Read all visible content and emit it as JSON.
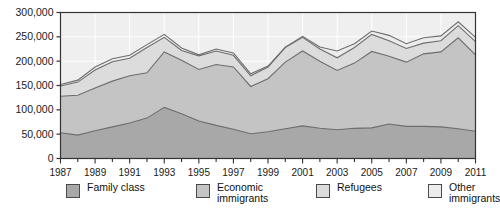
{
  "chart_data": {
    "type": "area",
    "stacked": true,
    "title": "",
    "xlabel": "",
    "ylabel": "",
    "x": [
      1987,
      1988,
      1989,
      1990,
      1991,
      1992,
      1993,
      1994,
      1995,
      1996,
      1997,
      1998,
      1999,
      2000,
      2001,
      2002,
      2003,
      2004,
      2005,
      2006,
      2007,
      2008,
      2009,
      2010,
      2011
    ],
    "tick_labels": [
      "1987",
      "1989",
      "1991",
      "1993",
      "1995",
      "1997",
      "1999",
      "2001",
      "2003",
      "2005",
      "2007",
      "2009",
      "2011"
    ],
    "ylim": [
      0,
      300000
    ],
    "yticks": [
      0,
      50000,
      100000,
      150000,
      200000,
      250000,
      300000
    ],
    "ytick_labels": [
      "0",
      "50,000",
      "100,000",
      "150,000",
      "200,000",
      "250,000",
      "300,000"
    ],
    "grid": true,
    "legend_position": "bottom",
    "series": [
      {
        "name": "Family class",
        "color": "#a8a8a8",
        "values": [
          53000,
          48000,
          57000,
          65000,
          73000,
          83000,
          105000,
          92000,
          77000,
          68000,
          60000,
          51000,
          55000,
          61000,
          67000,
          62000,
          59000,
          62000,
          63000,
          71000,
          66000,
          66000,
          65000,
          61000,
          56000
        ]
      },
      {
        "name": "Economic immigrants",
        "color": "#c4c4c4",
        "values": [
          75000,
          82000,
          88000,
          94000,
          97000,
          93000,
          114000,
          110000,
          106000,
          125000,
          128000,
          97000,
          109000,
          137000,
          154000,
          138000,
          122000,
          134000,
          157000,
          139000,
          132000,
          149000,
          154000,
          187000,
          157000
        ]
      },
      {
        "name": "Refugees",
        "color": "#dcdcdc",
        "values": [
          21000,
          27000,
          37000,
          40000,
          36000,
          52000,
          30000,
          20000,
          28000,
          28000,
          24000,
          22000,
          24000,
          30000,
          28000,
          25000,
          26000,
          32000,
          35000,
          32000,
          28000,
          22000,
          23000,
          25000,
          27000
        ]
      },
      {
        "name": "Other immigrants",
        "color": "#ececec",
        "values": [
          3000,
          4000,
          6000,
          6000,
          6000,
          6000,
          6000,
          5000,
          2000,
          4000,
          5000,
          4000,
          2000,
          1000,
          2000,
          4000,
          14000,
          8000,
          7000,
          11000,
          10000,
          11000,
          10000,
          8000,
          9000
        ]
      }
    ],
    "totals": [
      152000,
      161000,
      188000,
      205000,
      212000,
      234000,
      255000,
      227000,
      213000,
      225000,
      217000,
      174000,
      190000,
      229000,
      251000,
      229000,
      221000,
      236000,
      262000,
      253000,
      236000,
      248000,
      252000,
      281000,
      249000
    ]
  },
  "legend": {
    "items": [
      {
        "label": "Family class",
        "color": "#a8a8a8",
        "name": "family-class"
      },
      {
        "label": "Economic\nimmigrants",
        "color": "#c4c4c4",
        "name": "economic-immigrants"
      },
      {
        "label": "Refugees",
        "color": "#dcdcdc",
        "name": "refugees"
      },
      {
        "label": "Other\nimmigrants",
        "color": "#ececec",
        "name": "other-immigrants"
      }
    ]
  }
}
